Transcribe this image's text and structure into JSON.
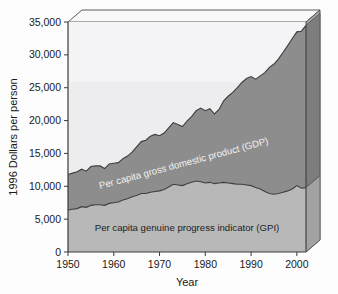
{
  "chart_data": {
    "type": "area",
    "title": "",
    "xlabel": "Year",
    "ylabel": "1996 Dollars per person",
    "xlim": [
      1950,
      2002
    ],
    "ylim": [
      0,
      35000
    ],
    "xticks": [
      "1950",
      "1960",
      "1970",
      "1980",
      "1990",
      "2000"
    ],
    "xtick_values": [
      1950,
      1960,
      1970,
      1980,
      1990,
      2000
    ],
    "yticks": [
      "0",
      "5,000",
      "10,000",
      "15,000",
      "20,000",
      "25,000",
      "30,000",
      "35,000"
    ],
    "ytick_values": [
      0,
      5000,
      10000,
      15000,
      20000,
      25000,
      30000,
      35000
    ],
    "grid": false,
    "legend_position": "inline-annotations",
    "annotations": [
      {
        "name": "gdp-band-label",
        "text": "Per capita gross domestic product (GDP)"
      },
      {
        "name": "gpi-band-label",
        "text": "Per capita genuine progress indicator (GPI)"
      }
    ],
    "colors": {
      "gdp_band": "#8d8d8d",
      "gpi_band": "#b8b8b8",
      "plot_background": "#ececee",
      "frame_top_face": "#f7f7f7",
      "frame_side_face": "#b0b0b0",
      "axis_line": "#3a3a3a",
      "gdp_label_text": "#f2f2f2",
      "gpi_label_text": "#222222"
    },
    "x": [
      1950,
      1951,
      1952,
      1953,
      1954,
      1955,
      1956,
      1957,
      1958,
      1959,
      1960,
      1961,
      1962,
      1963,
      1964,
      1965,
      1966,
      1967,
      1968,
      1969,
      1970,
      1971,
      1972,
      1973,
      1974,
      1975,
      1976,
      1977,
      1978,
      1979,
      1980,
      1981,
      1982,
      1983,
      1984,
      1985,
      1986,
      1987,
      1988,
      1989,
      1990,
      1991,
      1992,
      1993,
      1994,
      1995,
      1996,
      1997,
      1998,
      1999,
      2000,
      2001,
      2002
    ],
    "series": [
      {
        "name": "Per capita gross domestic product (GDP)",
        "values": [
          11800,
          12000,
          12200,
          12600,
          12300,
          13000,
          13100,
          13100,
          12700,
          13400,
          13500,
          13600,
          14200,
          14600,
          15200,
          16000,
          16800,
          17000,
          17600,
          17900,
          17700,
          18100,
          18900,
          19700,
          19400,
          19100,
          19900,
          20600,
          21500,
          21900,
          21500,
          21800,
          21000,
          21700,
          23000,
          23700,
          24300,
          25000,
          25800,
          26400,
          26700,
          26300,
          26800,
          27300,
          28100,
          28600,
          29400,
          30400,
          31400,
          32500,
          33500,
          33600,
          34500
        ]
      },
      {
        "name": "Per capita genuine progress indicator (GPI)",
        "values": [
          6400,
          6500,
          6600,
          6900,
          6800,
          7100,
          7200,
          7200,
          7100,
          7400,
          7500,
          7600,
          7900,
          8100,
          8400,
          8600,
          8900,
          8900,
          9100,
          9200,
          9300,
          9500,
          9900,
          10300,
          10200,
          10100,
          10400,
          10600,
          10800,
          10700,
          10500,
          10600,
          10400,
          10500,
          10600,
          10500,
          10400,
          10300,
          10300,
          10200,
          10100,
          9800,
          9600,
          9200,
          8900,
          8800,
          8900,
          9100,
          9300,
          9600,
          10100,
          9700,
          9800
        ]
      }
    ]
  },
  "axes": {
    "y_title": "1996 Dollars per person",
    "x_title": "Year"
  }
}
